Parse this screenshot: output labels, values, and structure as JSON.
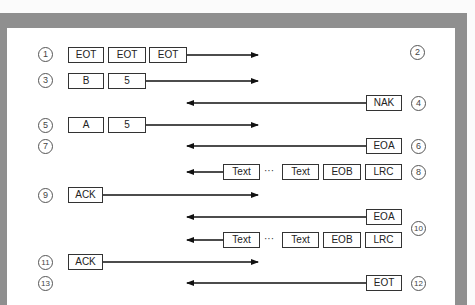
{
  "diagram": {
    "title": "",
    "steps": [
      {
        "n": "1",
        "side": "left",
        "frames": [
          "EOT",
          "EOT",
          "EOT"
        ],
        "direction": "right"
      },
      {
        "n": "2",
        "side": "right",
        "frames": [],
        "direction": ""
      },
      {
        "n": "3",
        "side": "left",
        "frames": [
          "B",
          "5"
        ],
        "direction": "right"
      },
      {
        "n": "4",
        "side": "right",
        "frames": [
          "NAK"
        ],
        "direction": "left"
      },
      {
        "n": "5",
        "side": "left",
        "frames": [
          "A",
          "5"
        ],
        "direction": "right"
      },
      {
        "n": "6",
        "side": "right",
        "frames": [
          "EOA"
        ],
        "direction": "left"
      },
      {
        "n": "7",
        "side": "left",
        "frames": [],
        "direction": ""
      },
      {
        "n": "8",
        "side": "right",
        "frames": [
          "Text",
          "…",
          "Text",
          "EOB",
          "LRC"
        ],
        "direction": "left"
      },
      {
        "n": "9",
        "side": "left",
        "frames": [
          "ACK"
        ],
        "direction": "right"
      },
      {
        "n": "10",
        "side": "right",
        "frames": [
          "EOA",
          "Text",
          "…",
          "Text",
          "EOB",
          "LRC"
        ],
        "direction": "left"
      },
      {
        "n": "11",
        "side": "left",
        "frames": [
          "ACK"
        ],
        "direction": "right"
      },
      {
        "n": "12",
        "side": "right",
        "frames": [
          "EOT"
        ],
        "direction": "left"
      },
      {
        "n": "13",
        "side": "left",
        "frames": [],
        "direction": ""
      }
    ],
    "labels": {
      "c1": "1",
      "c2": "2",
      "c3": "3",
      "c4": "4",
      "c5": "5",
      "c6": "6",
      "c7": "7",
      "c8": "8",
      "c9": "9",
      "c10": "10",
      "c11": "11",
      "c12": "12",
      "c13": "13",
      "eot": "EOT",
      "b": "B",
      "five": "5",
      "a": "A",
      "nak": "NAK",
      "eoa": "EOA",
      "text": "Text",
      "eob": "EOB",
      "lrc": "LRC",
      "ack": "ACK",
      "ellipsis": "···"
    }
  }
}
